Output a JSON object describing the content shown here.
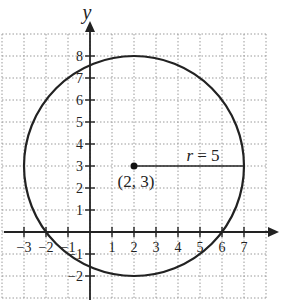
{
  "chart_data": {
    "type": "scatter",
    "title": "",
    "xlabel": "x",
    "ylabel": "y",
    "xlim": [
      -4,
      8
    ],
    "ylim": [
      -3,
      9
    ],
    "grid": true,
    "x_ticks": [
      -3,
      -2,
      -1,
      1,
      2,
      3,
      4,
      5,
      6,
      7
    ],
    "x_tick_labels": [
      "−3",
      "−2",
      "−1",
      "1",
      "2",
      "3",
      "4",
      "5",
      "6",
      "7"
    ],
    "y_ticks": [
      -2,
      -1,
      1,
      2,
      3,
      4,
      5,
      6,
      7,
      8
    ],
    "y_tick_labels": [
      "−2",
      "−1",
      "1",
      "2",
      "3",
      "4",
      "5",
      "6",
      "7",
      "8"
    ],
    "circle": {
      "center": [
        2,
        3
      ],
      "radius": 5
    },
    "center_point": {
      "x": 2,
      "y": 3,
      "label": "(2, 3)"
    },
    "radius_segment": {
      "from": [
        2,
        3
      ],
      "to": [
        7,
        3
      ],
      "label_var": "r",
      "label_rest": " = 5"
    }
  }
}
